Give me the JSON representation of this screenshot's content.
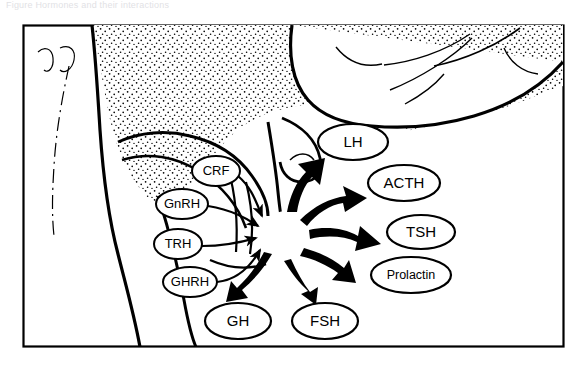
{
  "caption": {
    "text": "Figure  Hormones and their interactions"
  },
  "figure": {
    "frame": {
      "stroke": "#000000",
      "fill": "#ffffff"
    },
    "ink_color": "#000000",
    "background_color": "#ffffff",
    "stipple_region_name": "hypothalamus-stippled-tissue",
    "central_node": {
      "name": "pituitary-gland",
      "cx": 286,
      "cy": 235,
      "r": 24
    },
    "releasing_hormones": [
      {
        "id": "crf",
        "label": "CRF",
        "cx": 216,
        "cy": 171,
        "rx": 24,
        "ry": 15,
        "size": "small"
      },
      {
        "id": "gnrh",
        "label": "GnRH",
        "cx": 182,
        "cy": 204,
        "rx": 26,
        "ry": 15,
        "size": "small"
      },
      {
        "id": "trh",
        "label": "TRH",
        "cx": 178,
        "cy": 244,
        "rx": 24,
        "ry": 15,
        "size": "small"
      },
      {
        "id": "ghrh",
        "label": "GHRH",
        "cx": 190,
        "cy": 282,
        "rx": 27,
        "ry": 15,
        "size": "small"
      }
    ],
    "pituitary_hormones": [
      {
        "id": "lh",
        "label": "LH",
        "cx": 353,
        "cy": 142,
        "rx": 35,
        "ry": 18,
        "size": "normal"
      },
      {
        "id": "acth",
        "label": "ACTH",
        "cx": 404,
        "cy": 183,
        "rx": 36,
        "ry": 18,
        "size": "normal"
      },
      {
        "id": "tsh",
        "label": "TSH",
        "cx": 421,
        "cy": 232,
        "rx": 34,
        "ry": 17,
        "size": "normal"
      },
      {
        "id": "prolactin",
        "label": "Prolactin",
        "cx": 411,
        "cy": 275,
        "rx": 40,
        "ry": 18,
        "size": "normal"
      },
      {
        "id": "gh",
        "label": "GH",
        "cx": 238,
        "cy": 321,
        "rx": 33,
        "ry": 18,
        "size": "normal"
      },
      {
        "id": "fsh",
        "label": "FSH",
        "cx": 325,
        "cy": 321,
        "rx": 33,
        "ry": 18,
        "size": "normal"
      }
    ],
    "outgoing_arrow_targets": [
      "lh",
      "acth",
      "tsh",
      "prolactin",
      "fsh",
      "gh"
    ],
    "incoming_arrow_sources": [
      "crf",
      "gnrh",
      "trh",
      "ghrh"
    ]
  }
}
